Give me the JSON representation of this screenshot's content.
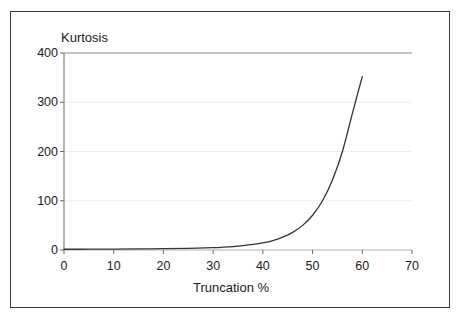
{
  "chart_data": {
    "type": "line",
    "title": "",
    "xlabel": "Truncation %",
    "ylabel": "Kurtosis",
    "xlim": [
      0,
      70
    ],
    "ylim": [
      0,
      400
    ],
    "xticks": [
      0,
      10,
      20,
      30,
      40,
      50,
      60,
      70
    ],
    "yticks": [
      0,
      100,
      200,
      300,
      400
    ],
    "xtick_labels": [
      "0",
      "10",
      "20",
      "30",
      "40",
      "50",
      "60",
      "70"
    ],
    "ytick_labels": [
      "0",
      "100",
      "200",
      "300",
      "400"
    ],
    "grid": true,
    "grid_style": "faint horizontal gridlines; solid gray line at y=400",
    "legend": null,
    "series": [
      {
        "name": "Kurtosis vs Truncation",
        "color": "#333333",
        "x": [
          0,
          5,
          10,
          15,
          20,
          25,
          30,
          32,
          34,
          36,
          38,
          40,
          42,
          44,
          46,
          48,
          50,
          52,
          54,
          56,
          58,
          59,
          60
        ],
        "y": [
          1.5,
          1.6,
          1.8,
          2.1,
          2.6,
          3.4,
          4.8,
          5.7,
          7.0,
          8.8,
          11.2,
          14.5,
          19.2,
          26.0,
          35.8,
          50.0,
          70.5,
          100.0,
          142.0,
          200.0,
          277.0,
          315.0,
          352.0
        ]
      }
    ],
    "notes": {
      "curve_start_value": 1.5,
      "curve_end_value": 352,
      "curve_end_x": 60,
      "crosses_100_at_x": 52,
      "crosses_200_at_x": 56,
      "crosses_300_at_x": 58.5
    }
  },
  "labels": {
    "y_axis_title": "Kurtosis",
    "x_axis_title": "Truncation %"
  },
  "colors": {
    "frame": "#3a3a3a",
    "axis": "#6b6b6b",
    "curve": "#333333",
    "grid": "#eeeeee",
    "text": "#1a1a1a",
    "background": "#ffffff"
  }
}
